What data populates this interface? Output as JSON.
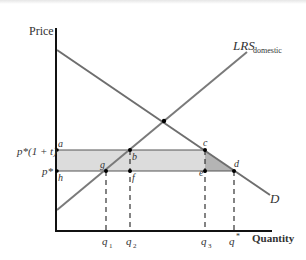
{
  "axes": {
    "y_label": "Price",
    "x_label": "Quantity"
  },
  "curves": {
    "demand_label": "D",
    "supply_label_main": "LRS",
    "supply_label_sub": "domestic"
  },
  "price_labels": {
    "tariff_price": "p*(1 + t)",
    "world_price": "p*"
  },
  "point_labels": {
    "a": "a",
    "b": "b",
    "c": "c",
    "d": "d",
    "e": "e",
    "f": "f",
    "g": "g",
    "h": "h"
  },
  "quantity_labels": {
    "q1_main": "q",
    "q1_sub": "1",
    "q2_main": "q",
    "q2_sub": "2",
    "q3_main": "q",
    "q3_sub": "3",
    "qstar_main": "q",
    "qstar_sup": "*"
  },
  "colors": {
    "axis": "#111111",
    "curve": "#6e6e6e",
    "rect_fill": "#dcdcdc",
    "triangle_fill": "#b4b4b4",
    "dashed": "#333333"
  }
}
